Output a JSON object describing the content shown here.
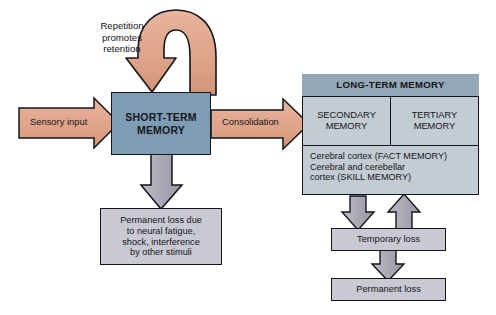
{
  "diagram": {
    "background_color": "#ffffff",
    "colors": {
      "short_term_box": "#7f9cb5",
      "long_term_header": "#93a7b6",
      "long_term_body": "#c3ccd2",
      "loss_box": "#c8c9d2",
      "salmon_arrow": "#dfa48a",
      "gray_arrow": "#a8a9b4",
      "outline": "#15161a",
      "text": "#15161a"
    }
  },
  "nodes": {
    "short_term_memory": {
      "line1": "SHORT-TERM",
      "line2": "MEMORY"
    },
    "long_term_memory": {
      "header": "LONG-TERM MEMORY",
      "secondary": {
        "line1": "SECONDARY",
        "line2": "MEMORY"
      },
      "tertiary": {
        "line1": "TERTIARY",
        "line2": "MEMORY"
      },
      "substrate": {
        "line1": "Cerebral cortex (FACT MEMORY)",
        "line2": "Cerebral and cerebellar",
        "line3": "cortex (SKILL MEMORY)"
      }
    },
    "permanent_loss_stm": {
      "line1": "Permanent loss due",
      "line2": "to neural fatigue,",
      "line3": "shock, interference",
      "line4": "by other stimuli"
    },
    "temporary_loss": {
      "label": "Temporary loss"
    },
    "permanent_loss_ltm": {
      "label": "Permanent loss"
    }
  },
  "arrows": {
    "sensory_input": {
      "label": "Sensory input"
    },
    "consolidation": {
      "label": "Consolidation"
    },
    "repetition_loop": {
      "line1": "Repetition",
      "line2": "promotes",
      "line3": "retention"
    },
    "secondary_to_tertiary": {
      "label": ""
    },
    "stm_to_permanent_loss": {
      "label": ""
    },
    "ltm_to_temporary_loss": {
      "label": ""
    },
    "temporary_loss_to_ltm": {
      "label": ""
    },
    "temporary_to_permanent_loss": {
      "label": ""
    }
  }
}
